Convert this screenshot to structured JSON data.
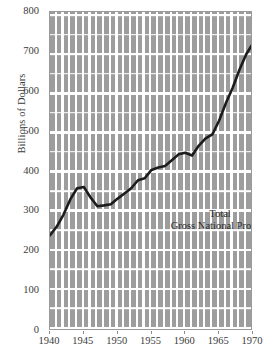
{
  "chart_data": {
    "type": "line",
    "title": "",
    "subtitle": "",
    "xlabel": "",
    "ylabel": "Billions of Dollars",
    "xlim": [
      1940,
      1970
    ],
    "ylim": [
      0,
      800
    ],
    "grid": true,
    "legend_position": "inline-annotation",
    "annotations": [
      {
        "text_line1": "Total",
        "text_line2": "Gross National Product",
        "x": 1951.5,
        "y": 320
      }
    ],
    "x_tick_labels": [
      "1940",
      "1945",
      "1950",
      "1955",
      "1960",
      "1965",
      "1970"
    ],
    "x_ticks": [
      1940,
      1945,
      1950,
      1955,
      1960,
      1965,
      1970
    ],
    "y_tick_labels": [
      "0",
      "100",
      "200",
      "300",
      "400",
      "500",
      "600",
      "700",
      "800"
    ],
    "y_ticks": [
      0,
      100,
      200,
      300,
      400,
      500,
      600,
      700,
      800
    ],
    "series": [
      {
        "name": "Total Gross National Product",
        "color": "#1c1c1c",
        "x": [
          1940,
          1941,
          1942,
          1943,
          1944,
          1945,
          1946,
          1947,
          1948,
          1949,
          1950,
          1951,
          1952,
          1953,
          1954,
          1955,
          1956,
          1957,
          1958,
          1959,
          1960,
          1961,
          1962,
          1963,
          1964,
          1965,
          1966,
          1967,
          1968,
          1969,
          1970
        ],
        "values": [
          240,
          262,
          292,
          330,
          358,
          361,
          335,
          313,
          315,
          318,
          332,
          345,
          358,
          378,
          383,
          404,
          410,
          414,
          428,
          443,
          447,
          440,
          465,
          483,
          493,
          528,
          572,
          610,
          655,
          694,
          722
        ]
      }
    ]
  },
  "axis": {
    "y_title": "Billions of Dollars"
  }
}
